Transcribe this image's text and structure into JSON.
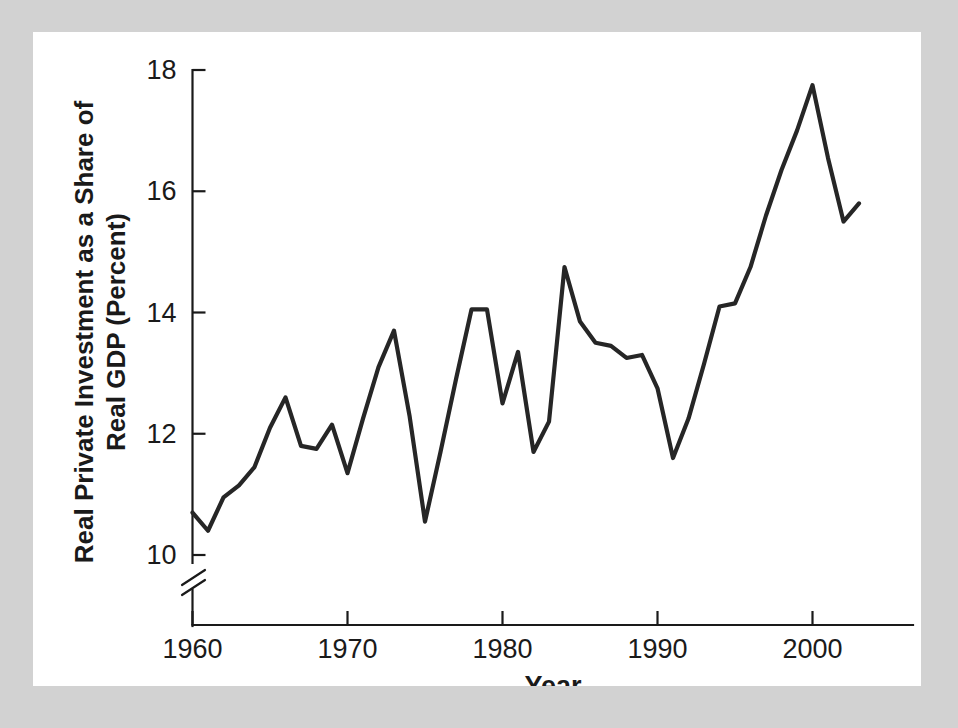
{
  "figure": {
    "panel_background": "#ffffff",
    "frame_background": "#d2d2d2",
    "line_color": "#262626",
    "axis_color": "#1a1a1a"
  },
  "chart_data": {
    "type": "line",
    "title": "",
    "xlabel": "Year",
    "ylabel": "Real Private Investment as a Share of Real GDP (Percent)",
    "ylabel_line1": "Real Private Investment as a Share of",
    "ylabel_line2": "Real GDP (Percent)",
    "xlim": [
      1959.4,
      2003.4
    ],
    "ylim": [
      9.35,
      18.35
    ],
    "grid": false,
    "legend": null,
    "axis_break": {
      "axis": "y",
      "below": 10,
      "symbol": "double-slash"
    },
    "xticks": [
      1960,
      1970,
      1980,
      1990,
      2000
    ],
    "xtick_labels": [
      "1960",
      "1970",
      "1980",
      "1990",
      "2000"
    ],
    "yticks": [
      10,
      12,
      14,
      16,
      18
    ],
    "ytick_labels": [
      "10",
      "12",
      "14",
      "16",
      "18"
    ],
    "x": [
      1960,
      1961,
      1962,
      1963,
      1964,
      1965,
      1966,
      1967,
      1968,
      1969,
      1970,
      1971,
      1972,
      1973,
      1974,
      1975,
      1976,
      1977,
      1978,
      1979,
      1980,
      1981,
      1982,
      1983,
      1984,
      1985,
      1986,
      1987,
      1988,
      1989,
      1990,
      1991,
      1992,
      1993,
      1994,
      1995,
      1996,
      1997,
      1998,
      1999,
      2000,
      2001,
      2002,
      2003
    ],
    "values": [
      10.7,
      10.4,
      10.95,
      11.15,
      11.45,
      12.1,
      12.6,
      11.8,
      11.75,
      12.15,
      11.35,
      12.25,
      13.1,
      13.7,
      12.3,
      10.55,
      11.7,
      12.9,
      14.05,
      14.05,
      12.5,
      13.35,
      11.7,
      12.2,
      14.75,
      13.85,
      13.5,
      13.45,
      13.25,
      13.3,
      12.75,
      11.6,
      12.25,
      13.15,
      14.1,
      14.15,
      14.75,
      15.6,
      16.35,
      17.0,
      17.75,
      16.55,
      15.5,
      15.8
    ],
    "series": [
      {
        "name": "Real private investment share of real GDP",
        "values": [
          10.7,
          10.4,
          10.95,
          11.15,
          11.45,
          12.1,
          12.6,
          11.8,
          11.75,
          12.15,
          11.35,
          12.25,
          13.1,
          13.7,
          12.3,
          10.55,
          11.7,
          12.9,
          14.05,
          14.05,
          12.5,
          13.35,
          11.7,
          12.2,
          14.75,
          13.85,
          13.5,
          13.45,
          13.25,
          13.3,
          12.75,
          11.6,
          12.25,
          13.15,
          14.1,
          14.15,
          14.75,
          15.6,
          16.35,
          17.0,
          17.75,
          16.55,
          15.5,
          15.8
        ]
      }
    ],
    "notable": {
      "max_value": 17.75,
      "max_year": 2000,
      "min_value": 10.4,
      "min_year": 1961
    }
  }
}
